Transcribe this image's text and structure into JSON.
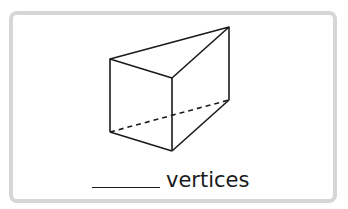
{
  "figure": {
    "shape": "triangular-prism",
    "stroke_color": "#1a1a1a",
    "border_color": "#d6d6d6",
    "vertices": {
      "top_left": [
        110,
        59
      ],
      "top_back": [
        229,
        27
      ],
      "top_front": [
        172,
        78
      ],
      "bottom_left": [
        110,
        132
      ],
      "bottom_back": [
        229,
        100
      ],
      "bottom_front": [
        172,
        151
      ]
    },
    "hidden_edge": "bottom_left-bottom_back (dashed)"
  },
  "question": {
    "blank": "______",
    "label": "vertices"
  }
}
